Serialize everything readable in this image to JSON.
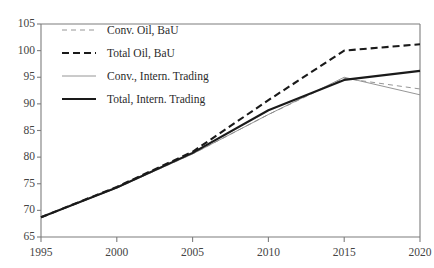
{
  "chart_data": {
    "type": "line",
    "title": "",
    "xlabel": "",
    "ylabel": "",
    "xlim": [
      1995,
      2020
    ],
    "ylim": [
      65,
      105
    ],
    "grid": false,
    "legend_position": "upper-left",
    "x": [
      1995,
      2000,
      2005,
      2010,
      2015,
      2020
    ],
    "xticks": [
      "1995",
      "2000",
      "2005",
      "2010",
      "2015",
      "2020"
    ],
    "yticks": [
      "65",
      "70",
      "75",
      "80",
      "85",
      "90",
      "95",
      "100",
      "105"
    ],
    "series": [
      {
        "name": "Conv. Oil, BaU",
        "style": "dashed",
        "width": "thin",
        "color": "#8a8a8a",
        "values": [
          68.7,
          74.2,
          80.6,
          88.0,
          94.8,
          92.8
        ]
      },
      {
        "name": "Total Oil, BaU",
        "style": "dashed",
        "width": "thick",
        "color": "#1a1a1a",
        "values": [
          68.7,
          74.4,
          81.0,
          90.7,
          100.0,
          101.2
        ]
      },
      {
        "name": "Conv., Intern. Trading",
        "style": "solid",
        "width": "thin",
        "color": "#8a8a8a",
        "values": [
          68.7,
          74.2,
          80.6,
          88.0,
          95.0,
          91.7
        ]
      },
      {
        "name": "Total, Intern. Trading",
        "style": "solid",
        "width": "thick",
        "color": "#1a1a1a",
        "values": [
          68.7,
          74.3,
          80.8,
          88.8,
          94.5,
          96.2
        ]
      }
    ]
  },
  "legend": {
    "items": [
      {
        "label": "Conv. Oil, BaU",
        "swatch": "dashed-thin-gray"
      },
      {
        "label": "Total Oil, BaU",
        "swatch": "dashed-thick-black"
      },
      {
        "label": "Conv., Intern. Trading",
        "swatch": "solid-thin-gray"
      },
      {
        "label": "Total, Intern. Trading",
        "swatch": "solid-thick-black"
      }
    ]
  },
  "axes": {
    "y": {
      "labels": [
        "105",
        "100",
        "95",
        "90",
        "85",
        "80",
        "75",
        "70",
        "65"
      ]
    },
    "x": {
      "labels": [
        "1995",
        "2000",
        "2005",
        "2010",
        "2015",
        "2020"
      ]
    }
  },
  "colors": {
    "axis": "#7d7d7d",
    "series_dark": "#1a1a1a",
    "series_light": "#8a8a8a",
    "tick_text": "#444444",
    "background": "#ffffff"
  }
}
